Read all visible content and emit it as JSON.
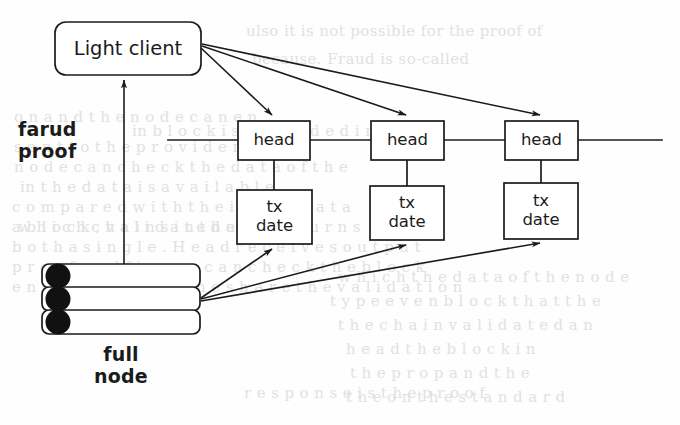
{
  "figure": {
    "type": "diagram",
    "background_color": "#fefefe",
    "stroke_color": "#1b1b1b"
  },
  "nodes": {
    "light_client": {
      "label": "Light client",
      "shape": "rounded-rectangle",
      "x": 55,
      "y": 22,
      "w": 146,
      "h": 53
    },
    "full_node": {
      "label": "full\nnode",
      "shape": "stacked-rounded-rectangles",
      "layers": 3,
      "x": 42,
      "y": 264,
      "w": 158,
      "h": 69,
      "disc_color": "#111111"
    },
    "heads": [
      {
        "label": "head",
        "x": 238,
        "y": 121,
        "w": 72,
        "h": 39
      },
      {
        "label": "head",
        "x": 371,
        "y": 121,
        "w": 73,
        "h": 39
      },
      {
        "label": "head",
        "x": 505,
        "y": 121,
        "w": 73,
        "h": 39
      }
    ],
    "tx_blocks": [
      {
        "label": "tx\ndate",
        "x": 237,
        "y": 190,
        "w": 75,
        "h": 54
      },
      {
        "label": "tx\ndate",
        "x": 370,
        "y": 186,
        "w": 74,
        "h": 54
      },
      {
        "label": "tx\ndate",
        "x": 504,
        "y": 183,
        "w": 74,
        "h": 56
      }
    ]
  },
  "labels": {
    "fraud_proof": "farud\nproof",
    "full_node": "full\nnode"
  },
  "edges": {
    "chain_line": {
      "y": 140,
      "x_start": 168,
      "x_end": 662
    },
    "fraud_proof_arrow": {
      "from": "full-node",
      "to": "light-client",
      "x": 124,
      "y_start": 264,
      "y_end": 79
    },
    "light_client_to_heads": 3,
    "full_node_to_tx": 3,
    "head_to_tx_connectors": 3
  },
  "bleed_text": {
    "lines": [
      {
        "text": "ulso it is not possible for the proof of",
        "x": 246,
        "y": 22
      },
      {
        "text": "because. Fraud is so-called",
        "x": 252,
        "y": 50
      },
      {
        "text": "o n  a n d  t h e  n o d e  c a n  e n",
        "x": 14,
        "y": 108
      },
      {
        "text": "in  b l o c k  i s  i n c l u d e d  i n  t h e",
        "x": 132,
        "y": 122
      },
      {
        "text": "s e n t  t o  t h e  p r o v i d e r .  A",
        "x": 14,
        "y": 138
      },
      {
        "text": "n o d e  c a n  c h e c k  t h e  d a t a  o f  t h e",
        "x": 14,
        "y": 158
      },
      {
        "text": "in  t h e  d a t a  i s  a v a i l a b l e",
        "x": 20,
        "y": 178
      },
      {
        "text": "c o m p a r e d  w i t h  t h e i r  o w n  d a t a",
        "x": 12,
        "y": 198
      },
      {
        "text": "a  b l o c k ,  v a l i d a t e d  a n d  r e t u r n s",
        "x": 12,
        "y": 218
      },
      {
        "text": "b o t h  a  s i n g l e .  H e a d  r e c e i v e s  o u t p u t",
        "x": 12,
        "y": 238
      },
      {
        "text": "p r o o f  a n d  f i g u r e  c a n  c h e c k  t h e  b l o c k",
        "x": 12,
        "y": 258
      },
      {
        "text": "e n c o u n t e r  a n d  t h e  s h a r e  t h e  v a l i d a t i o n",
        "x": 12,
        "y": 278
      },
      {
        "text": "w h i c h  t h e  d a t a  o f  t h e  n o d e",
        "x": 338,
        "y": 268
      },
      {
        "text": "t y p e  e v e n  b l o c k  t h a t  t h e",
        "x": 330,
        "y": 292
      },
      {
        "text": "t h e  c h a i n  v a l i d a t e d  a n",
        "x": 338,
        "y": 316
      },
      {
        "text": "h e a d  t h e  b l o c k  i n",
        "x": 346,
        "y": 340
      },
      {
        "text": "t h e  p r o p  a n d  t h e",
        "x": 350,
        "y": 364
      },
      {
        "text": "t h e  o n  t h e  s t a n d a r d",
        "x": 346,
        "y": 388
      },
      {
        "text": "w h i c h  c h a i n s  i n  t h e  S Y N C",
        "x": 18,
        "y": 218
      },
      {
        "text": "r e s p o n s e  i s  t h e  p r o o f",
        "x": 244,
        "y": 384
      }
    ]
  }
}
